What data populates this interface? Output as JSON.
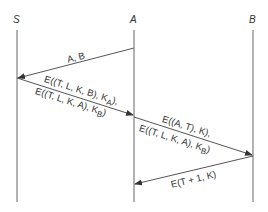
{
  "diagram": {
    "type": "sequence-diagram",
    "participants": [
      {
        "id": "S",
        "label": "S",
        "x": 17
      },
      {
        "id": "A",
        "label": "A",
        "x": 134
      },
      {
        "id": "B",
        "label": "B",
        "x": 253
      }
    ],
    "messages": [
      {
        "from": "A",
        "to": "S",
        "lines": [
          "A, B"
        ]
      },
      {
        "from": "S",
        "to": "A",
        "lines": [
          "E((T, L, K, B), K_A),",
          "E((T, L, K, A), K_B)"
        ]
      },
      {
        "from": "A",
        "to": "B",
        "lines": [
          "E((A, T), K),",
          "E((T, L, K, A), K_B)"
        ]
      },
      {
        "from": "B",
        "to": "A",
        "lines": [
          "E(T + 1, K)"
        ]
      }
    ],
    "line_color": "#555555",
    "text_color": "#333333"
  },
  "labels": {
    "S": "S",
    "A": "A",
    "B": "B",
    "m1": "A, B",
    "m2a": "E((T, L, K, B), K",
    "m2a_sub": "A",
    "m2a_end": "),",
    "m2b": "E((T, L, K, A), K",
    "m2b_sub": "B",
    "m2b_end": ")",
    "m3a": "E((A, T), K),",
    "m3b": "E((T, L, K, A), K",
    "m3b_sub": "B",
    "m3b_end": ")",
    "m4": "E(T + 1, K)"
  }
}
